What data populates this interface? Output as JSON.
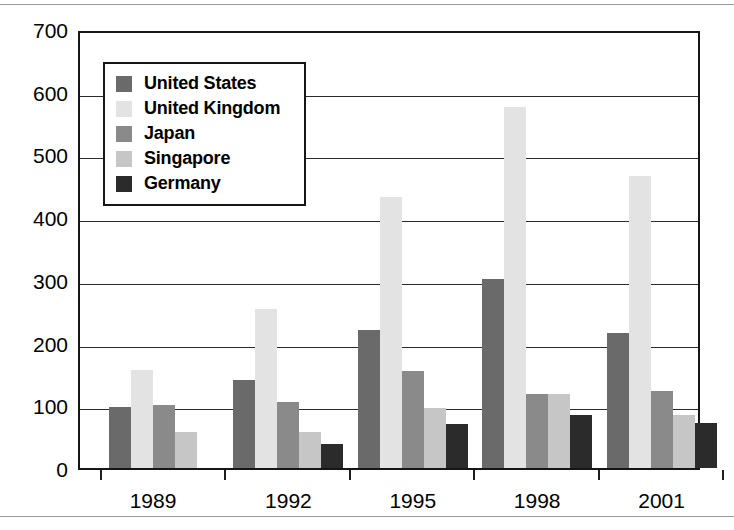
{
  "chart_data": {
    "type": "bar",
    "title": "",
    "subtitle": "",
    "xlabel": "",
    "ylabel": "",
    "categories": [
      "1989",
      "1992",
      "1995",
      "1998",
      "2001"
    ],
    "series": [
      {
        "name": "United States",
        "color": "#6a6a6a",
        "values": [
          97,
          140,
          220,
          302,
          215
        ]
      },
      {
        "name": "United Kingdom",
        "color": "#e3e3e3",
        "values": [
          157,
          253,
          432,
          576,
          466
        ]
      },
      {
        "name": "Japan",
        "color": "#8a8a8a",
        "values": [
          100,
          105,
          155,
          118,
          123
        ]
      },
      {
        "name": "Singapore",
        "color": "#c6c6c6",
        "values": [
          57,
          57,
          95,
          118,
          85
        ]
      },
      {
        "name": "Germany",
        "color": "#2b2b2b",
        "values": [
          null,
          38,
          70,
          85,
          72
        ]
      }
    ],
    "ylim": [
      0,
      700
    ],
    "yticks": [
      0,
      100,
      200,
      300,
      400,
      500,
      600,
      700
    ],
    "ytick_labels": [
      "0",
      "100",
      "200",
      "300",
      "400",
      "500",
      "600",
      "700"
    ],
    "grid": true,
    "legend_position": "upper-left"
  },
  "legend": {
    "entries": [
      {
        "label": "United States"
      },
      {
        "label": "United Kingdom"
      },
      {
        "label": "Japan"
      },
      {
        "label": "Singapore"
      },
      {
        "label": "Germany"
      }
    ]
  },
  "colors": {
    "axis": "#161616",
    "gridline": "#2b2b2b",
    "page_rule": "#9a9a9a",
    "background": "#ffffff"
  }
}
